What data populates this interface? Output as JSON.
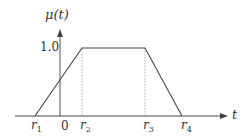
{
  "diagram": {
    "type": "trapezoidal-membership-function",
    "y_axis_label": "μ(t)",
    "x_axis_label": "t",
    "plateau_label": "1.0",
    "origin_label": "0",
    "x_ticks": [
      {
        "name": "r",
        "sub": "1"
      },
      {
        "name": "r",
        "sub": "2"
      },
      {
        "name": "r",
        "sub": "3"
      },
      {
        "name": "r",
        "sub": "4"
      }
    ],
    "colors": {
      "line": "#444444",
      "dashed": "#999999"
    }
  }
}
